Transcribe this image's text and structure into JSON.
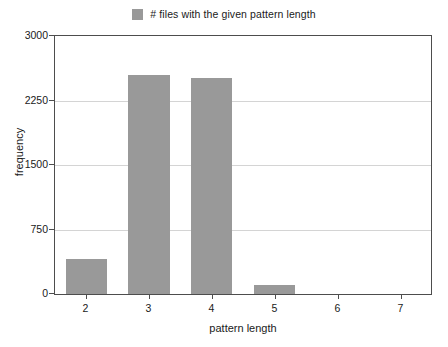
{
  "chart_data": {
    "type": "bar",
    "title": "",
    "subtitle": "",
    "xlabel": "pattern length",
    "ylabel": "frequency",
    "categories": [
      "2",
      "3",
      "4",
      "5",
      "6",
      "7"
    ],
    "values": [
      410,
      2545,
      2510,
      110,
      0,
      0
    ],
    "series": [
      {
        "name": "# files with the given pattern length",
        "values": [
          410,
          2545,
          2510,
          110,
          0,
          0
        ],
        "color": "#999999"
      }
    ],
    "ylim": [
      0,
      3000
    ],
    "yticks": [
      0,
      750,
      1500,
      2250,
      3000
    ],
    "ytick_labels": [
      "0",
      "750",
      "1500",
      "2250",
      "3000"
    ],
    "xtick_labels": [
      "2",
      "3",
      "4",
      "5",
      "6",
      "7"
    ],
    "grid": true,
    "grid_axis": "y",
    "legend_position": "top-center",
    "legend_entries": [
      {
        "label": "# files with the given pattern length",
        "color": "#999999"
      }
    ]
  },
  "legend": {
    "label": "# files with the given pattern length"
  },
  "axes": {
    "x_title": "pattern length",
    "y_title": "frequency",
    "y_labels": [
      "3000",
      "2250",
      "1500",
      "750",
      "0"
    ],
    "x_labels": [
      "2",
      "3",
      "4",
      "5",
      "6",
      "7"
    ]
  },
  "colors": {
    "bar": "#999999",
    "frame": "#4d4d4d",
    "grid": "#d4d4d4",
    "text": "#1a1a1a",
    "background": "#ffffff"
  }
}
